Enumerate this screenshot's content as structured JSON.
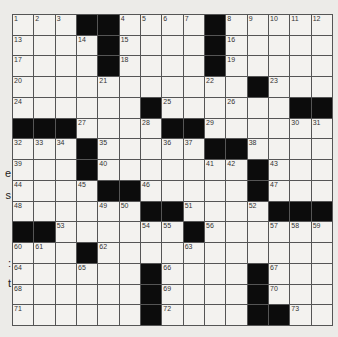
{
  "puzzle": {
    "rows": 15,
    "cols": 15,
    "colors": {
      "block": "#0c0c0c",
      "cell": "#f3f2ef",
      "line": "#555555",
      "page": "#ecebe8"
    },
    "grid": [
      [
        "1",
        "2",
        "3",
        "#",
        "#",
        "4",
        "5",
        "6",
        "7",
        "#",
        "8",
        "9",
        "10",
        "11",
        "12"
      ],
      [
        "13",
        "",
        "",
        "14",
        "#",
        "15",
        "",
        "",
        "",
        "#",
        "16",
        "",
        "",
        "",
        ""
      ],
      [
        "17",
        "",
        "",
        "",
        "#",
        "18",
        "",
        "",
        "",
        "#",
        "19",
        "",
        "",
        "",
        ""
      ],
      [
        "20",
        "",
        "",
        "",
        "21",
        "",
        "",
        "",
        "",
        "22",
        "",
        "#",
        "23",
        "",
        ""
      ],
      [
        "24",
        "",
        "",
        "",
        "",
        "",
        "#",
        "25",
        "",
        "",
        "26",
        "",
        "",
        "#",
        "#"
      ],
      [
        "#",
        "#",
        "#",
        "27",
        "",
        "",
        "28",
        "#",
        "#",
        "29",
        "",
        "",
        "",
        "30",
        "31"
      ],
      [
        "32",
        "33",
        "34",
        "#",
        "35",
        "",
        "",
        "36",
        "37",
        "#",
        "#",
        "38",
        "",
        "",
        ""
      ],
      [
        "39",
        "",
        "",
        "#",
        "40",
        "",
        "",
        "",
        "",
        "41",
        "42",
        "#",
        "43",
        "",
        ""
      ],
      [
        "44",
        "",
        "",
        "45",
        "#",
        "#",
        "46",
        "",
        "",
        "",
        "",
        "#",
        "47",
        "",
        ""
      ],
      [
        "48",
        "",
        "",
        "",
        "49",
        "50",
        "#",
        "#",
        "51",
        "",
        "",
        "52",
        "#",
        "#",
        "#"
      ],
      [
        "#",
        "#",
        "53",
        "",
        "",
        "",
        "54",
        "55",
        "#",
        "56",
        "",
        "",
        "57",
        "58",
        "59"
      ],
      [
        "60",
        "61",
        "",
        "#",
        "62",
        "",
        "",
        "",
        "63",
        "",
        "",
        "",
        "",
        "",
        ""
      ],
      [
        "64",
        "",
        "",
        "65",
        "",
        "",
        "#",
        "66",
        "",
        "",
        "",
        "#",
        "67",
        "",
        ""
      ],
      [
        "68",
        "",
        "",
        "",
        "",
        "",
        "#",
        "69",
        "",
        "",
        "",
        "#",
        "70",
        "",
        ""
      ],
      [
        "71",
        "",
        "",
        "",
        "",
        "",
        "#",
        "72",
        "",
        "",
        "",
        "#",
        "#",
        "73",
        ""
      ]
    ]
  },
  "margin_fragments": [
    {
      "text": "e",
      "top": 167
    },
    {
      "text": "s",
      "top": 189
    },
    {
      "text": ":",
      "top": 257
    },
    {
      "text": "t",
      "top": 277
    }
  ]
}
